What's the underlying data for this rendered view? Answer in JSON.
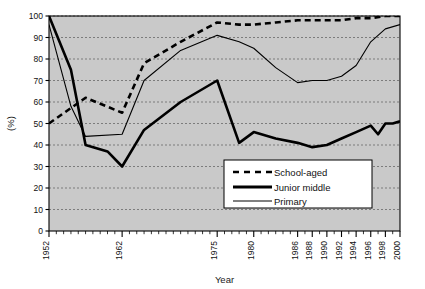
{
  "chart_data": {
    "type": "line",
    "title": "",
    "xlabel": "Year",
    "ylabel": "(%)",
    "ylim": [
      0,
      100
    ],
    "ytick_labels": [
      "0",
      "10",
      "20",
      "30",
      "40",
      "50",
      "60",
      "70",
      "80",
      "90",
      "100"
    ],
    "yticks": [
      0,
      10,
      20,
      30,
      40,
      50,
      60,
      70,
      80,
      90,
      100
    ],
    "xlim": [
      1952,
      2000
    ],
    "xtick_labels": [
      "1952",
      "1962",
      "1975",
      "1980",
      "1986",
      "1988",
      "1990",
      "1992",
      "1994",
      "1996",
      "1998",
      "2000"
    ],
    "xticks": [
      1952,
      1962,
      1975,
      1980,
      1986,
      1988,
      1990,
      1992,
      1994,
      1996,
      1998,
      2000
    ],
    "grid": "horizontal-dashed",
    "legend_position": "lower-right-inside",
    "plot_background": "#c9c9c9",
    "line_color": "#000000",
    "series": [
      {
        "name": "School-aged",
        "style": "thick-dashed",
        "x": [
          1952,
          1957,
          1962,
          1965,
          1970,
          1975,
          1978,
          1980,
          1983,
          1986,
          1988,
          1990,
          1992,
          1994,
          1996,
          1998,
          2000
        ],
        "values": [
          50,
          62,
          55,
          78,
          88,
          97,
          96,
          96,
          97,
          98,
          98,
          98,
          98,
          99,
          99,
          100,
          100
        ]
      },
      {
        "name": "Junior middle",
        "style": "thick-solid",
        "x": [
          1952,
          1955,
          1957,
          1960,
          1962,
          1965,
          1970,
          1975,
          1978,
          1980,
          1983,
          1986,
          1988,
          1990,
          1992,
          1994,
          1996,
          1997,
          1998,
          1999,
          2000
        ],
        "values": [
          100,
          75,
          40,
          37,
          30,
          47,
          60,
          70,
          41,
          46,
          43,
          41,
          39,
          40,
          43,
          46,
          49,
          45,
          50,
          50,
          51
        ]
      },
      {
        "name": "Primary",
        "style": "thin-solid",
        "x": [
          1952,
          1955,
          1957,
          1962,
          1965,
          1970,
          1975,
          1978,
          1980,
          1983,
          1986,
          1988,
          1990,
          1992,
          1994,
          1996,
          1998,
          2000
        ],
        "values": [
          96,
          58,
          44,
          45,
          70,
          84,
          91,
          88,
          85,
          76,
          69,
          70,
          70,
          72,
          77,
          88,
          94,
          96
        ]
      }
    ]
  },
  "legend": {
    "items": [
      {
        "label": "School-aged"
      },
      {
        "label": "Junior middle"
      },
      {
        "label": "Primary"
      }
    ]
  }
}
